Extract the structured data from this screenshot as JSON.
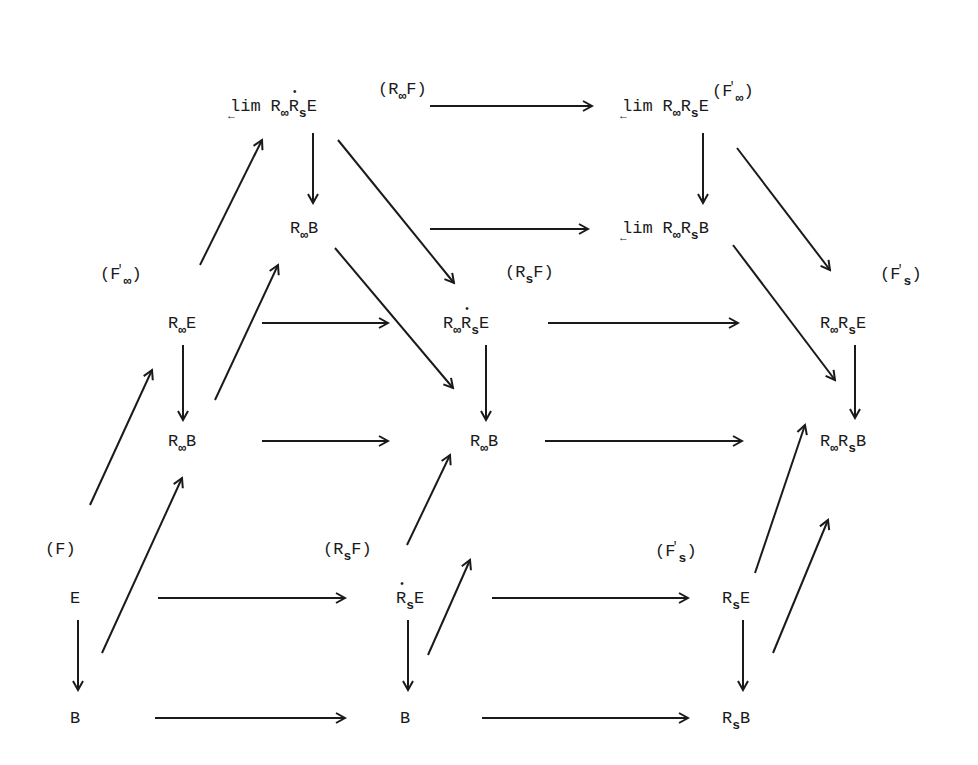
{
  "diagram": {
    "fibration_labels": [
      {
        "id": "F",
        "text": "(F)",
        "x": 45,
        "y": 540
      },
      {
        "id": "RsF_front",
        "text": "(RsF)",
        "x": 323,
        "y": 540
      },
      {
        "id": "Fs_prime_front",
        "text": "(F's)",
        "x": 655,
        "y": 540
      },
      {
        "id": "Finf_prime",
        "text": "(F'∞)",
        "x": 100,
        "y": 263
      },
      {
        "id": "RsF_mid",
        "text": "(RsF)",
        "x": 505,
        "y": 263
      },
      {
        "id": "Fs_prime_mid",
        "text": "(F's)",
        "x": 880,
        "y": 263
      },
      {
        "id": "RinfF",
        "text": "(R∞F)",
        "x": 378,
        "y": 80
      },
      {
        "id": "Finf_prime_top",
        "text": "(F'∞)",
        "x": 712,
        "y": 80
      }
    ],
    "nodes": [
      {
        "id": "E",
        "text": "E",
        "x": 70,
        "y": 590
      },
      {
        "id": "B",
        "text": "B",
        "x": 70,
        "y": 710
      },
      {
        "id": "RsdotE",
        "text": "ṘsE",
        "x": 398,
        "y": 590
      },
      {
        "id": "B2",
        "text": "B",
        "x": 398,
        "y": 710
      },
      {
        "id": "RsE",
        "text": "RsE",
        "x": 725,
        "y": 590
      },
      {
        "id": "RsB",
        "text": "RsB",
        "x": 725,
        "y": 710
      },
      {
        "id": "RinfE",
        "text": "R∞E",
        "x": 168,
        "y": 325
      },
      {
        "id": "RinfB_left",
        "text": "R∞B",
        "x": 168,
        "y": 445
      },
      {
        "id": "RinfRsdotE",
        "text": "R∞ṘsE",
        "x": 445,
        "y": 325
      },
      {
        "id": "RinfB_mid",
        "text": "R∞B",
        "x": 468,
        "y": 445
      },
      {
        "id": "RinfRsE",
        "text": "R∞RsE",
        "x": 822,
        "y": 325
      },
      {
        "id": "RinfRsB",
        "text": "R∞RsB",
        "x": 822,
        "y": 445
      },
      {
        "id": "limRinfRsdotE",
        "text": "lim R∞ṘsE",
        "x": 230,
        "y": 110
      },
      {
        "id": "RinfB_top",
        "text": "R∞B",
        "x": 288,
        "y": 230
      },
      {
        "id": "limRinfRsE",
        "text": "lim R∞RsE",
        "x": 620,
        "y": 110
      },
      {
        "id": "limRinfRsB",
        "text": "lim R∞RsB",
        "x": 620,
        "y": 230
      }
    ],
    "arrows": [
      {
        "from": "E",
        "to": "B",
        "x1": 78,
        "y1": 620,
        "x2": 78,
        "y2": 690
      },
      {
        "from": "E",
        "to": "RsdotE",
        "x1": 158,
        "y1": 598,
        "x2": 345,
        "y2": 598
      },
      {
        "from": "RsdotE",
        "to": "RsE",
        "x1": 492,
        "y1": 598,
        "x2": 688,
        "y2": 598
      },
      {
        "from": "B",
        "to": "B2",
        "x1": 155,
        "y1": 718,
        "x2": 345,
        "y2": 718
      },
      {
        "from": "B2",
        "to": "RsB",
        "x1": 482,
        "y1": 718,
        "x2": 688,
        "y2": 718
      },
      {
        "from": "RsdotE",
        "to": "B2",
        "x1": 408,
        "y1": 620,
        "x2": 408,
        "y2": 690
      },
      {
        "from": "RsE",
        "to": "RsB",
        "x1": 743,
        "y1": 620,
        "x2": 743,
        "y2": 690
      },
      {
        "from": "E",
        "to": "RinfE",
        "x1": 90,
        "y1": 505,
        "x2": 152,
        "y2": 370
      },
      {
        "from": "B",
        "to": "RinfB_left",
        "x1": 102,
        "y1": 653,
        "x2": 182,
        "y2": 478
      },
      {
        "from": "RsdotE",
        "to": "RinfRsdotE",
        "x1": 407,
        "y1": 545,
        "x2": 450,
        "y2": 455
      },
      {
        "from": "B2",
        "to": "RinfB_mid",
        "x1": 428,
        "y1": 655,
        "x2": 470,
        "y2": 560
      },
      {
        "from": "RsE",
        "to": "RinfRsE",
        "x1": 755,
        "y1": 573,
        "x2": 805,
        "y2": 425
      },
      {
        "from": "RsB",
        "to": "RinfRsB",
        "x1": 773,
        "y1": 653,
        "x2": 828,
        "y2": 520
      },
      {
        "from": "RinfE",
        "to": "RinfB_left",
        "x1": 183,
        "y1": 345,
        "x2": 183,
        "y2": 420
      },
      {
        "from": "RinfE",
        "to": "RinfRsdotE",
        "x1": 262,
        "y1": 323,
        "x2": 388,
        "y2": 323
      },
      {
        "from": "RinfRsdotE",
        "to": "RinfRsE",
        "x1": 548,
        "y1": 323,
        "x2": 738,
        "y2": 323
      },
      {
        "from": "RinfB_left",
        "to": "RinfB_mid",
        "x1": 262,
        "y1": 441,
        "x2": 388,
        "y2": 441
      },
      {
        "from": "RinfB_mid",
        "to": "RinfRsB",
        "x1": 545,
        "y1": 441,
        "x2": 742,
        "y2": 441
      },
      {
        "from": "RinfRsdotE",
        "to": "RinfB_mid",
        "x1": 486,
        "y1": 345,
        "x2": 486,
        "y2": 420
      },
      {
        "from": "RinfRsE",
        "to": "RinfRsB",
        "x1": 855,
        "y1": 345,
        "x2": 855,
        "y2": 418
      },
      {
        "from": "RinfE",
        "to": "limRinfRsdotE",
        "x1": 200,
        "y1": 265,
        "x2": 262,
        "y2": 140
      },
      {
        "from": "RinfB_left",
        "to": "RinfB_top",
        "x1": 215,
        "y1": 400,
        "x2": 278,
        "y2": 265
      },
      {
        "from": "limRinfRsdotE",
        "to": "RinfB_top",
        "x1": 313,
        "y1": 133,
        "x2": 313,
        "y2": 203
      },
      {
        "from": "limRinfRsdotE",
        "to": "limRinfRsE",
        "x1": 430,
        "y1": 106,
        "x2": 592,
        "y2": 106
      },
      {
        "from": "RinfB_top",
        "to": "limRinfRsB",
        "x1": 430,
        "y1": 229,
        "x2": 588,
        "y2": 229
      },
      {
        "from": "limRinfRsE",
        "to": "limRinfRsB",
        "x1": 703,
        "y1": 133,
        "x2": 703,
        "y2": 203
      },
      {
        "from": "limRinfRsdotE",
        "to": "RinfRsdotE",
        "x1": 338,
        "y1": 140,
        "x2": 454,
        "y2": 283
      },
      {
        "from": "RinfB_top",
        "to": "RinfB_mid",
        "x1": 335,
        "y1": 248,
        "x2": 453,
        "y2": 388
      },
      {
        "from": "limRinfRsE",
        "to": "RinfRsE",
        "x1": 737,
        "y1": 148,
        "x2": 830,
        "y2": 270
      },
      {
        "from": "limRinfRsB",
        "to": "RinfRsB",
        "x1": 733,
        "y1": 245,
        "x2": 835,
        "y2": 380
      }
    ]
  }
}
